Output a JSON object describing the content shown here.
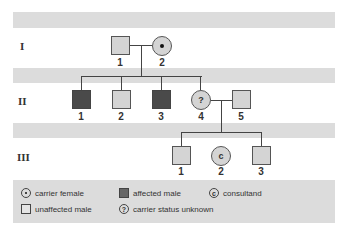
{
  "generations": [
    {
      "label": "I"
    },
    {
      "label": "II"
    },
    {
      "label": "III"
    }
  ],
  "individuals": {
    "I": [
      {
        "number": "1",
        "sex": "male",
        "status": "unaffected"
      },
      {
        "number": "2",
        "sex": "female",
        "status": "carrier"
      }
    ],
    "II": [
      {
        "number": "1",
        "sex": "male",
        "status": "affected"
      },
      {
        "number": "2",
        "sex": "male",
        "status": "unaffected"
      },
      {
        "number": "3",
        "sex": "male",
        "status": "affected"
      },
      {
        "number": "4",
        "sex": "female",
        "status": "carrier status unknown",
        "mark": "?"
      },
      {
        "number": "5",
        "sex": "male",
        "status": "unaffected"
      }
    ],
    "III": [
      {
        "number": "1",
        "sex": "male",
        "status": "unaffected"
      },
      {
        "number": "2",
        "sex": "female",
        "status": "consultand",
        "mark": "c"
      },
      {
        "number": "3",
        "sex": "male",
        "status": "unaffected"
      }
    ]
  },
  "legend": {
    "carrier_female": "carrier female",
    "affected_male": "affected male",
    "consultand": "consultand",
    "consultand_mark": "c",
    "unaffected_male": "unaffected male",
    "unknown": "carrier status unknown",
    "unknown_mark": "?"
  },
  "colors": {
    "band": "#dcdcdc",
    "unaffected_fill": "#d4d4d4",
    "affected_fill": "#4a4a4a",
    "line": "#444444"
  }
}
